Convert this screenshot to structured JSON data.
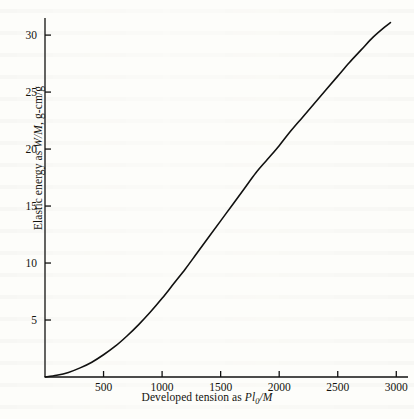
{
  "figure": {
    "background_color": "#fdfdfa",
    "ink_color": "#111110"
  },
  "chart_data": {
    "type": "line",
    "title": "",
    "subtitle": "",
    "xlabel": "Developed tension as Pl0/M",
    "xlabel_parts": {
      "lead": "Developed tension as ",
      "sym1": "Pl",
      "sub": "0",
      "sym2": "/M"
    },
    "ylabel": "Elastic energy as W/M, g-cm/g",
    "ylabel_parts": {
      "lead": "Elastic energy as ",
      "sym1": "W/M",
      "tail": ", g-cm/g"
    },
    "xlim": [
      0,
      3100
    ],
    "ylim": [
      0,
      31.5
    ],
    "xticks": [
      500,
      1000,
      1500,
      2000,
      2500,
      3000
    ],
    "xtick_labels": [
      "500",
      "1000",
      "1500",
      "2000",
      "2500",
      "3000"
    ],
    "yticks": [
      5,
      10,
      15,
      20,
      25,
      30
    ],
    "ytick_labels": [
      "5",
      "10",
      "15",
      "20",
      "25",
      "30"
    ],
    "grid": false,
    "legend": null,
    "axis_spines": [
      "left",
      "bottom"
    ],
    "series": [
      {
        "name": "elastic energy",
        "color": "#111110",
        "linewidth": 1.6,
        "x": [
          0,
          100,
          200,
          300,
          400,
          500,
          600,
          700,
          800,
          900,
          1000,
          1100,
          1200,
          1300,
          1400,
          1500,
          1600,
          1700,
          1800,
          1900,
          2000,
          2100,
          2200,
          2300,
          2400,
          2500,
          2600,
          2700,
          2800,
          2900,
          2950
        ],
        "y": [
          0.0,
          0.15,
          0.4,
          0.8,
          1.3,
          1.95,
          2.7,
          3.6,
          4.6,
          5.7,
          6.9,
          8.2,
          9.5,
          10.9,
          12.3,
          13.7,
          15.1,
          16.5,
          17.9,
          19.1,
          20.3,
          21.6,
          22.8,
          24.0,
          25.2,
          26.4,
          27.6,
          28.7,
          29.8,
          30.7,
          31.1
        ]
      }
    ]
  }
}
